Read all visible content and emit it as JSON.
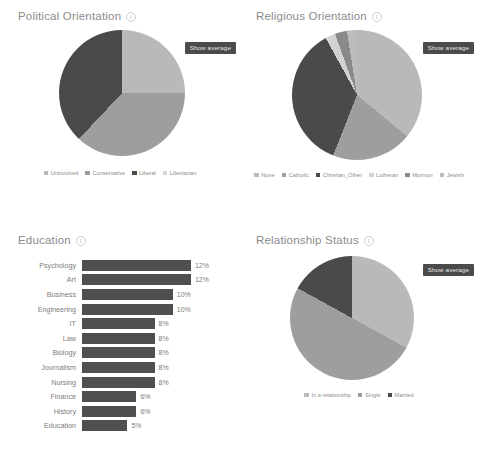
{
  "colors": {
    "light": "#b9b9b9",
    "medium": "#9e9e9e",
    "dark": "#4a4a4a",
    "darker": "#3f3f3f",
    "mid_light": "#a8a8a8",
    "bar": "#4f4f4f",
    "badge_bg": "#4b4b4b",
    "badge_text": "#e8e8e8",
    "title_text": "#8b8b8b"
  },
  "panels": {
    "political": {
      "title": "Political Orientation",
      "show_average_label": "Show average",
      "info_icon": "info-icon"
    },
    "religious": {
      "title": "Religious Orientation",
      "show_average_label": "Show average",
      "info_icon": "info-icon"
    },
    "education": {
      "title": "Education",
      "info_icon": "info-icon"
    },
    "relationship": {
      "title": "Relationship Status",
      "show_average_label": "Show average",
      "info_icon": "info-icon"
    }
  },
  "chart_data": [
    {
      "type": "pie",
      "title": "Political Orientation",
      "legend_position": "bottom",
      "categories": [
        "Uninvolved",
        "Conservative",
        "Liberal",
        "Libertarian"
      ],
      "values": [
        25,
        37,
        38,
        0
      ],
      "colors": [
        "#b9b9b9",
        "#9e9e9e",
        "#4a4a4a",
        "#d6d6d6"
      ]
    },
    {
      "type": "pie",
      "title": "Religious Orientation",
      "legend_position": "bottom",
      "categories": [
        "None",
        "Catholic",
        "Christian_Other",
        "Lutheran",
        "Mormon",
        "Jewish"
      ],
      "values": [
        36,
        20,
        36,
        2.5,
        3,
        2.5
      ],
      "colors": [
        "#b9b9b9",
        "#9e9e9e",
        "#4a4a4a",
        "#d2d2d2",
        "#8a8a8a",
        "#bdbdbd"
      ]
    },
    {
      "type": "bar",
      "title": "Education",
      "orientation": "horizontal",
      "categories": [
        "Psychology",
        "Art",
        "Business",
        "Engineering",
        "IT",
        "Law",
        "Biology",
        "Journalism",
        "Nursing",
        "Finance",
        "History",
        "Education"
      ],
      "values": [
        12,
        12,
        10,
        10,
        8,
        8,
        8,
        8,
        8,
        6,
        6,
        5
      ],
      "value_labels": [
        "12%",
        "12%",
        "10%",
        "10%",
        "8%",
        "8%",
        "8%",
        "8%",
        "8%",
        "6%",
        "6%",
        "5%"
      ],
      "xlabel": "",
      "ylabel": "",
      "xlim": [
        0,
        13
      ],
      "grid": false
    },
    {
      "type": "pie",
      "title": "Relationship Status",
      "legend_position": "bottom",
      "categories": [
        "In a relationship",
        "Single",
        "Married"
      ],
      "values": [
        33,
        50,
        17
      ],
      "colors": [
        "#b9b9b9",
        "#9e9e9e",
        "#4a4a4a"
      ]
    }
  ]
}
